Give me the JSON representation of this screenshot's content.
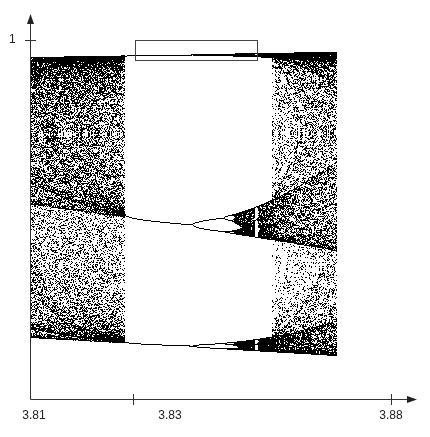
{
  "chart_data": {
    "type": "scatter",
    "title": "",
    "subtitle": "Bifurcation diagram of the logistic map x(n+1) = r·x(n)·(1−x(n)), zoom on period-3 window",
    "xlabel": "",
    "ylabel": "",
    "x_range": [
      3.81,
      3.88
    ],
    "x_ticks": [
      {
        "value": 3.81,
        "label": "3.81"
      },
      {
        "value": 3.83,
        "label": "3.83"
      },
      {
        "value": 3.88,
        "label": "3.88"
      }
    ],
    "y_ticks": [
      {
        "value": 1,
        "label": "1"
      }
    ],
    "y_range": [
      0,
      1
    ],
    "grid": false,
    "legend": null,
    "series": [
      {
        "name": "logistic map attractor",
        "marker": "dot",
        "color": "#000000",
        "r_start": 3.81,
        "r_end": 3.8693,
        "features": {
          "chaotic_band_left": [
            3.81,
            3.8284
          ],
          "period3_window_start": 3.8284,
          "period_doubling_to_6": 3.8415,
          "window_end_crisis": 3.8568,
          "chaotic_band_right": [
            3.8568,
            3.8693
          ]
        }
      }
    ],
    "annotations": [
      {
        "type": "rectangle",
        "label": "zoom region",
        "r_from": 3.8303,
        "r_to": 3.8541,
        "y_from": 0.945,
        "y_to": 1.0
      }
    ]
  },
  "axes": {
    "x_tick_labels": [
      "3.81",
      "3.83",
      "3.88"
    ],
    "y_tick_labels": [
      "1"
    ]
  },
  "render": {
    "iterations_discard": 300,
    "iterations_plot": 220,
    "columns": 360
  }
}
